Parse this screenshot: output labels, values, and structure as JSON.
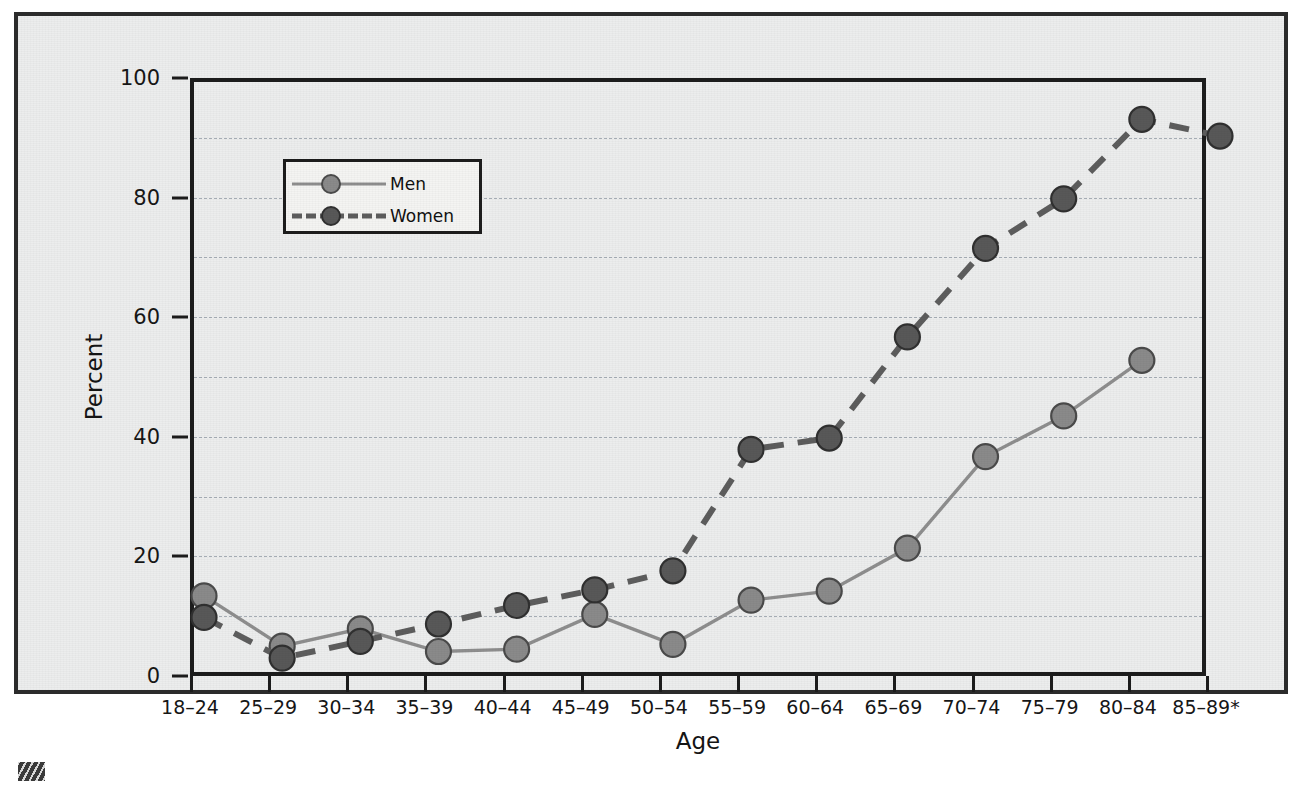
{
  "chart_data": {
    "type": "line",
    "title": "",
    "xlabel": "Age",
    "ylabel": "Percent",
    "ylim": [
      0,
      100
    ],
    "ytick_labels": [
      "0",
      "20",
      "40",
      "60",
      "80",
      "100"
    ],
    "yticks": [
      0,
      20,
      40,
      60,
      80,
      100
    ],
    "gridlines_minor": [
      10,
      30,
      50,
      70,
      90
    ],
    "grid": true,
    "legend_position": "upper-left-inside",
    "categories": [
      "18–24",
      "25–29",
      "30–34",
      "35–39",
      "40–44",
      "45–49",
      "50–54",
      "55–59",
      "60–64",
      "65–69",
      "70–74",
      "75–79",
      "80–84",
      "85–89*"
    ],
    "series": [
      {
        "name": "Men",
        "line_style": "solid",
        "color": "#8e8e8e",
        "marker_color": "#8a8a8a",
        "marker_edge": "#4a4a4a",
        "values": [
          15.4,
          7.0,
          9.9,
          6.1,
          6.5,
          12.3,
          7.3,
          14.7,
          16.2,
          23.4,
          38.7,
          45.5,
          54.8,
          null
        ]
      },
      {
        "name": "Women",
        "line_style": "dashed",
        "color": "#5d5d5d",
        "marker_color": "#585858",
        "marker_edge": "#303030",
        "values": [
          11.8,
          5.0,
          7.8,
          10.7,
          13.8,
          16.4,
          19.6,
          39.9,
          41.8,
          58.7,
          73.5,
          81.8,
          95.1,
          92.3
        ]
      }
    ]
  },
  "legend": {
    "entries": [
      {
        "label": "Men"
      },
      {
        "label": "Women"
      }
    ]
  },
  "colors": {
    "frame": "#2b2b2b",
    "axis": "#1c1c1c",
    "background": "#eceded",
    "gridline": "#9aa3ac",
    "men": "#8a8a8a",
    "women": "#585858"
  }
}
